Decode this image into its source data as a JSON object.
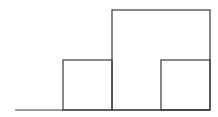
{
  "diagram": {
    "stroke_color": "#3a3a3a",
    "background": "#ffffff",
    "shapes": {
      "baseline": {
        "x1": 15,
        "y1": 110,
        "x2": 210,
        "y2": 110
      },
      "small_box_left": {
        "x": 63,
        "y": 60,
        "w": 49,
        "h": 50
      },
      "tall_box": {
        "x": 112,
        "y": 10,
        "w": 98,
        "h": 100
      },
      "small_box_right": {
        "x": 161,
        "y": 60,
        "w": 49,
        "h": 50
      }
    }
  }
}
